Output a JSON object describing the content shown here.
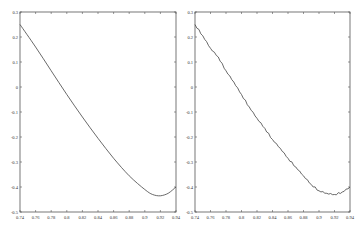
{
  "chart_data": [
    {
      "type": "line",
      "title": "",
      "xlabel": "",
      "ylabel": "",
      "xlim": [
        0.74,
        0.94
      ],
      "ylim": [
        -0.5,
        0.3
      ],
      "grid": false,
      "xticks": [
        "0.74",
        "0.76",
        "0.78",
        "0.8",
        "0.82",
        "0.84",
        "0.86",
        "0.88",
        "0.9",
        "0.92",
        "0.94"
      ],
      "yticks": [
        "0.3",
        "0.2",
        "0.1",
        "0",
        "-0.1",
        "-0.2",
        "-0.3",
        "-0.4",
        "-0.5"
      ],
      "series": [
        {
          "name": "smooth",
          "style": "smooth",
          "x": [
            0.74,
            0.76,
            0.78,
            0.8,
            0.82,
            0.84,
            0.86,
            0.88,
            0.9,
            0.91,
            0.92,
            0.93,
            0.94
          ],
          "values": [
            0.25,
            0.16,
            0.065,
            -0.03,
            -0.12,
            -0.205,
            -0.285,
            -0.355,
            -0.41,
            -0.43,
            -0.435,
            -0.425,
            -0.4
          ]
        }
      ]
    },
    {
      "type": "line",
      "title": "",
      "xlabel": "",
      "ylabel": "",
      "xlim": [
        0.74,
        0.94
      ],
      "ylim": [
        -0.5,
        0.3
      ],
      "grid": false,
      "xticks": [
        "0.74",
        "0.76",
        "0.78",
        "0.8",
        "0.82",
        "0.84",
        "0.86",
        "0.88",
        "0.9",
        "0.92",
        "0.94"
      ],
      "yticks": [
        "0.3",
        "0.2",
        "0.1",
        "0",
        "-0.1",
        "-0.2",
        "-0.3",
        "-0.4",
        "-0.5"
      ],
      "series": [
        {
          "name": "noisy",
          "style": "noisy",
          "x": [
            0.74,
            0.75,
            0.76,
            0.77,
            0.78,
            0.79,
            0.8,
            0.81,
            0.82,
            0.83,
            0.84,
            0.85,
            0.86,
            0.87,
            0.88,
            0.89,
            0.9,
            0.91,
            0.92,
            0.93,
            0.94
          ],
          "values": [
            0.25,
            0.205,
            0.155,
            0.12,
            0.065,
            0.02,
            -0.03,
            -0.08,
            -0.125,
            -0.165,
            -0.21,
            -0.245,
            -0.285,
            -0.32,
            -0.355,
            -0.39,
            -0.415,
            -0.425,
            -0.43,
            -0.42,
            -0.4
          ]
        }
      ]
    }
  ]
}
